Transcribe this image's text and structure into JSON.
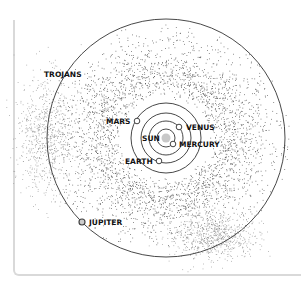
{
  "diagram": {
    "center": {
      "x": 166,
      "y": 138
    },
    "colors": {
      "orbit": "#333333",
      "dust": "#555555",
      "dust_light": "#9a9a9a",
      "sun": "#c8c8c8",
      "planet_fill": "#ffffff",
      "planet_stroke": "#444444",
      "card_border": "#d9d9d9"
    },
    "labels": {
      "trojans": "TROJANS",
      "mars": "MARS",
      "venus": "VENUS",
      "sun": "SUN",
      "mercury": "MERCURY",
      "earth": "EARTH",
      "jupiter": "JUPITER"
    },
    "bodies": [
      {
        "name": "Sun",
        "x": 166,
        "y": 138,
        "r": 5
      },
      {
        "name": "Mercury",
        "x": 173,
        "y": 144,
        "r": 3,
        "orbit_r": 10
      },
      {
        "name": "Venus",
        "x": 179,
        "y": 127,
        "r": 3,
        "orbit_r": 20
      },
      {
        "name": "Earth",
        "x": 159,
        "y": 161,
        "r": 3,
        "orbit_r": 28
      },
      {
        "name": "Mars",
        "x": 137,
        "y": 121,
        "r": 3,
        "orbit_r": 38
      },
      {
        "name": "Jupiter",
        "x": 82,
        "y": 222,
        "r": 3,
        "orbit_r": 119
      }
    ]
  }
}
